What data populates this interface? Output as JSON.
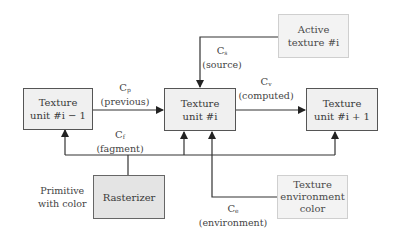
{
  "nodes": {
    "prev_unit": {
      "line1": "Texture",
      "line2": "unit #i − 1"
    },
    "cur_unit": {
      "line1": "Texture",
      "line2": "unit #i"
    },
    "next_unit": {
      "line1": "Texture",
      "line2": "unit #i + 1"
    },
    "active_texture": {
      "line1": "Active",
      "line2": "texture #i"
    },
    "rasterizer": {
      "line1": "Rasterizer"
    },
    "env_color": {
      "line1": "Texture",
      "line2": "environment",
      "line3": "color"
    }
  },
  "edges": {
    "previous": {
      "symbol": "C",
      "sub": "p",
      "name": "(previous)"
    },
    "source": {
      "symbol": "C",
      "sub": "s",
      "name": "(source)"
    },
    "computed": {
      "symbol": "C",
      "sub": "v",
      "name": "(computed)"
    },
    "fragment": {
      "symbol": "C",
      "sub": "f",
      "name": "(fagment)"
    },
    "environment": {
      "symbol": "C",
      "sub": "e",
      "name": "(environment)"
    }
  },
  "annotations": {
    "primitive": {
      "line1": "Primitive",
      "line2": "with color"
    }
  },
  "colors": {
    "line": "#333333",
    "box_fill": "#f0f0f0",
    "rasterizer_fill": "#e4e4e4"
  }
}
